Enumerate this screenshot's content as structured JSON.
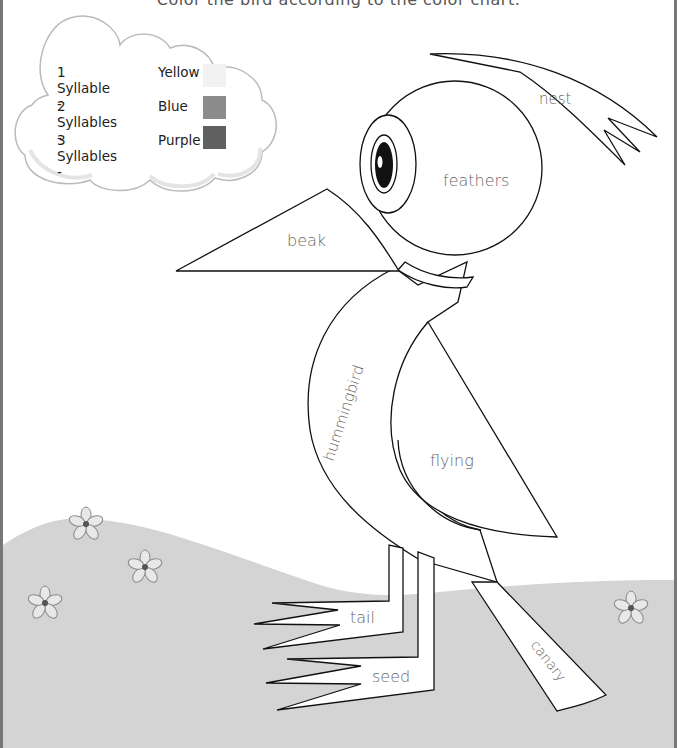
{
  "instruction": "Color the bird according to the color chart.",
  "legend": {
    "rows": [
      {
        "syllables": "1 Syllable -",
        "color_name": "Yellow",
        "swatch": "#f2f2f2"
      },
      {
        "syllables": "2 Syllables -",
        "color_name": "Blue",
        "swatch": "#8c8c8c"
      },
      {
        "syllables": "3 Syllables -",
        "color_name": "Purple",
        "swatch": "#606060"
      }
    ]
  },
  "bird_parts": {
    "head": "feathers",
    "beak": "beak",
    "crest": "nest",
    "body": "hummingbird",
    "wing": "flying",
    "foot_upper": "tail",
    "foot_lower": "seed",
    "tail": "canary"
  },
  "colors": {
    "outline": "#111111",
    "label_text": "#666666",
    "ground": "#d4d4d4",
    "cloud_outline": "#bbbbbb",
    "flower_fill": "#e8e8e8",
    "flower_center": "#555555"
  }
}
